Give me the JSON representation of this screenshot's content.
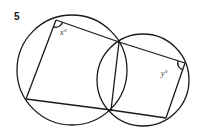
{
  "question_number": "5",
  "diagram": {
    "stroke_color": "#1a1a1a",
    "angle_labels": {
      "x": "x°",
      "y": "y°"
    },
    "points": [
      "A",
      "B",
      "C",
      "D",
      "E",
      "F"
    ],
    "shapes": {
      "large_circle": "circle through A, B, E, F",
      "small_circle": "circle through B, C, D, E",
      "quadrilateral_1": [
        "A",
        "B",
        "E",
        "F"
      ],
      "quadrilateral_2": [
        "B",
        "C",
        "D",
        "E"
      ],
      "common_chord": [
        "B",
        "E"
      ]
    }
  }
}
